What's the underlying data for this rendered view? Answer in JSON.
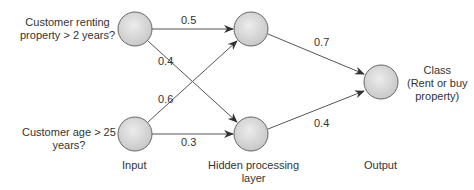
{
  "diagram": {
    "type": "neural-network",
    "layers": {
      "input": "Input",
      "hidden": "Hidden processing\nlayer",
      "hidden_line1": "Hidden processing",
      "hidden_line2": "layer",
      "output": "Output"
    },
    "inputs": [
      {
        "id": "i1",
        "line1": "Customer renting",
        "line2": "property > 2 years?"
      },
      {
        "id": "i2",
        "line1": "Customer age > 25",
        "line2": "years?"
      }
    ],
    "output_node": {
      "line1": "Class",
      "line2": "(Rent or buy",
      "line3": "property)"
    },
    "weights": {
      "i1_h1": "0.5",
      "i1_h2": "0.4",
      "i2_h1": "0.6",
      "i2_h2": "0.3",
      "h1_o": "0.7",
      "h2_o": "0.4"
    },
    "colors": {
      "node_fill": "#d9d9d9",
      "node_stroke": "#555555",
      "edge": "#444444"
    }
  }
}
